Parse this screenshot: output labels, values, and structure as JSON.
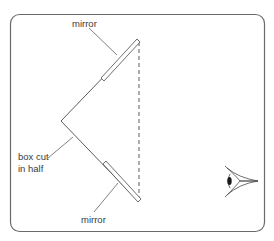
{
  "diagram": {
    "labels": {
      "mirror_top": "mirror",
      "mirror_bottom": "mirror",
      "box_line1": "box cut",
      "box_line2": "in half"
    },
    "elements": {
      "frame": "rounded rectangle border",
      "box": "box cut in half (V shape)",
      "mirror_top": "upper mirror",
      "mirror_bottom": "lower mirror",
      "dashed_line": "open side of box",
      "eye": "observer eye"
    },
    "colors": {
      "line": "#4a4a4a",
      "frame": "#6a6a6a",
      "text": "#3a3a3a",
      "background": "#ffffff"
    }
  }
}
